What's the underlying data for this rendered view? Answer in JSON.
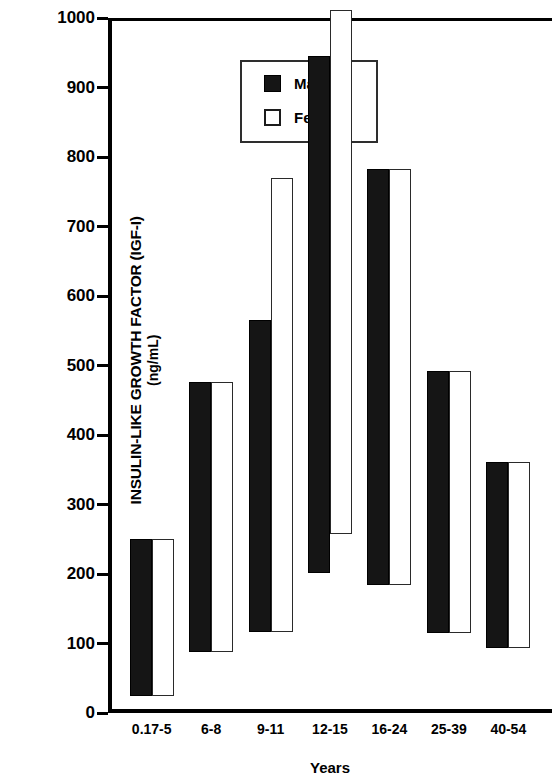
{
  "chart_data": {
    "type": "bar",
    "bar_style": "floating-range",
    "title": "",
    "xlabel": "Years",
    "ylabel": "INSULIN-LIKE GROWTH FACTOR (IGF-I) (ng/mL)",
    "ylabel_line1": "INSULIN-LIKE GROWTH FACTOR (IGF-I)",
    "ylabel_line2": "(ng/mL)",
    "ylim": [
      0,
      1000
    ],
    "yticks": [
      0,
      100,
      200,
      300,
      400,
      500,
      600,
      700,
      800,
      900,
      1000
    ],
    "ytick_labels": [
      "0",
      "100",
      "200",
      "300",
      "400",
      "500",
      "600",
      "700",
      "800",
      "900",
      "1000"
    ],
    "grid": false,
    "legend_position": "upper left",
    "categories": [
      "0.17-5",
      "6-8",
      "9-11",
      "12-15",
      "16-24",
      "25-39",
      "40-54"
    ],
    "series": [
      {
        "name": "Male",
        "color": "#151515",
        "ranges": [
          {
            "category": "0.17-5",
            "low": 25,
            "high": 250
          },
          {
            "category": "6-8",
            "low": 88,
            "high": 476
          },
          {
            "category": "9-11",
            "low": 117,
            "high": 565
          },
          {
            "category": "12-15",
            "low": 202,
            "high": 945
          },
          {
            "category": "16-24",
            "low": 184,
            "high": 783
          },
          {
            "category": "25-39",
            "low": 115,
            "high": 492
          },
          {
            "category": "40-54",
            "low": 94,
            "high": 361
          }
        ]
      },
      {
        "name": "Female",
        "color": "#ffffff",
        "ranges": [
          {
            "category": "0.17-5",
            "low": 25,
            "high": 250
          },
          {
            "category": "6-8",
            "low": 88,
            "high": 476
          },
          {
            "category": "9-11",
            "low": 117,
            "high": 770
          },
          {
            "category": "12-15",
            "low": 257,
            "high": 1012
          },
          {
            "category": "16-24",
            "low": 184,
            "high": 783
          },
          {
            "category": "25-39",
            "low": 115,
            "high": 492
          },
          {
            "category": "40-54",
            "low": 94,
            "high": 361
          }
        ]
      }
    ]
  },
  "legend": {
    "male_label": "Male",
    "female_label": "Female"
  },
  "axis": {
    "x_title": "Years"
  }
}
